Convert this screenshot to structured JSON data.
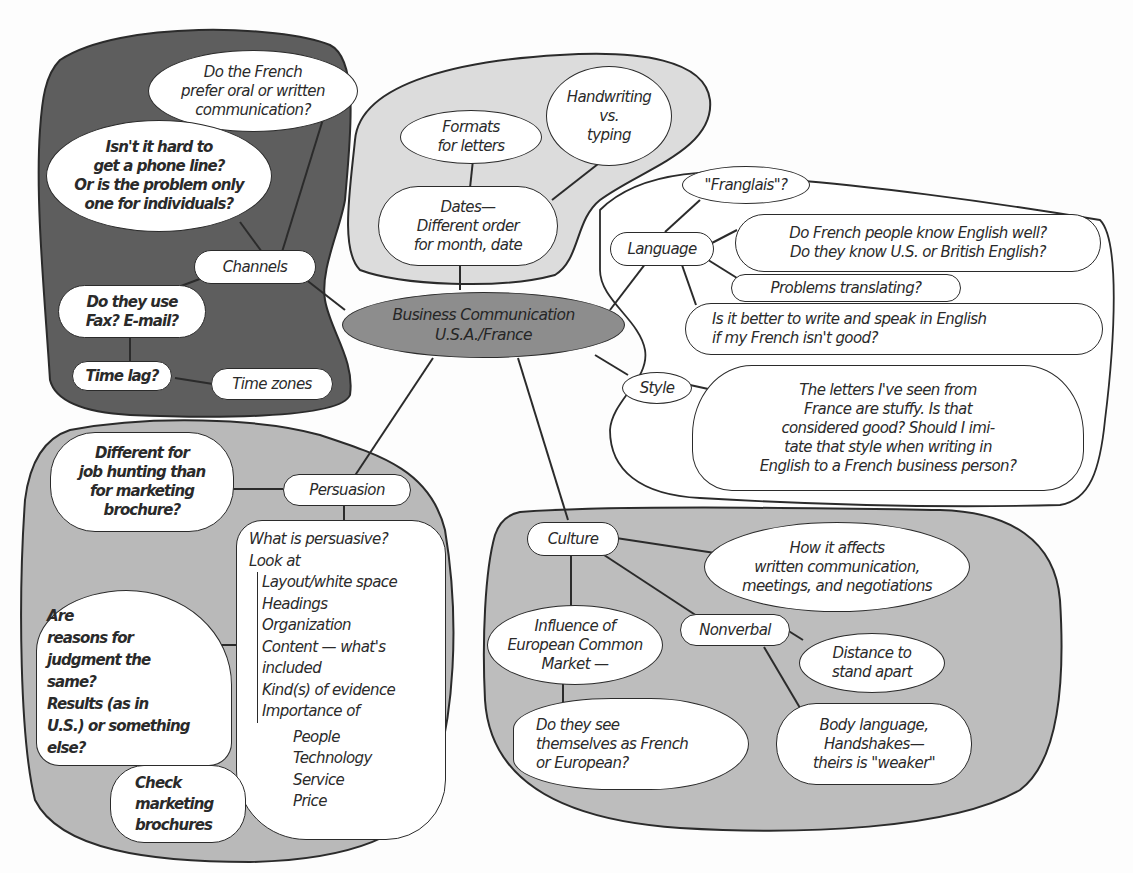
{
  "diagram": {
    "type": "mind-map",
    "center": {
      "line1": "Business Communication",
      "line2": "U.S.A./France"
    },
    "colors": {
      "center_fill": "#8d8d8d",
      "channels_region": "#5e5e5e",
      "formats_region": "#dcdcdc",
      "language_region": "#ffffff",
      "persuasion_region": "#b9b9b9",
      "culture_region": "#bdbdbd",
      "bubble_fill": "#ffffff",
      "line": "#2b2b2b"
    },
    "channels": {
      "label": "Channels",
      "oral_written": "Do the French\nprefer oral or written\ncommunication?",
      "phone_line": "Isn't it hard to\nget a phone line?\nOr is the problem only\none for individuals?",
      "fax_email": "Do they use\nFax? E-mail?",
      "time_lag": "Time lag?",
      "time_zones": "Time zones"
    },
    "formats": {
      "formats_letters": "Formats\nfor letters",
      "handwriting": "Handwriting\nvs.\ntyping",
      "dates": "Dates—\nDifferent order\nfor month, date"
    },
    "language": {
      "label": "Language",
      "franglais": "\"Franglais\"?",
      "know_english": "Do French people know English well?\nDo they know U.S. or British English?",
      "translating": "Problems translating?",
      "better_english": "Is it better to write and speak in English\nif my French isn't good?"
    },
    "style": {
      "label": "Style",
      "letters_stuffy": "The letters I've seen from\nFrance are stuffy. Is that\nconsidered good? Should I imi-\ntate that style when writing in\nEnglish to a French business person?"
    },
    "persuasion": {
      "label": "Persuasion",
      "job_hunting": "Different for\njob hunting than\nfor marketing\nbrochure?",
      "reasons": "Are\nreasons for\njudgment the\nsame?\nResults (as in\nU.S.) or something\nelse?",
      "check_brochures": "Check\nmarketing\nbrochures",
      "what_is": {
        "heading1": "What is persuasive?",
        "heading2": "Look at",
        "items": [
          "Layout/white space",
          "Headings",
          "Organization",
          "Content — what's",
          "included",
          "Kind(s) of evidence",
          "Importance of"
        ],
        "importance_of": [
          "People",
          "Technology",
          "Service",
          "Price"
        ]
      }
    },
    "culture": {
      "label": "Culture",
      "affects": "How it affects\nwritten communication,\nmeetings, and negotiations",
      "common_market": "Influence of\nEuropean Common\nMarket —",
      "french_or_european": "Do they see\nthemselves as French\nor European?",
      "nonverbal": "Nonverbal",
      "distance": "Distance to\nstand apart",
      "body_language": "Body language,\nHandshakes—\ntheirs is \"weaker\""
    }
  }
}
